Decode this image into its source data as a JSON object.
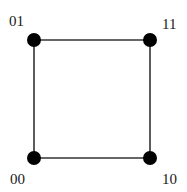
{
  "diagram": {
    "type": "graph",
    "shape": "square",
    "colors": {
      "node": "#000000",
      "edge": "#333333",
      "label": "#1a1a1a",
      "background": "#ffffff"
    },
    "nodes": [
      {
        "id": "01",
        "label": "01",
        "x": 34,
        "y": 40,
        "label_x": 9,
        "label_y": 26
      },
      {
        "id": "11",
        "label": "11",
        "x": 150,
        "y": 40,
        "label_x": 162,
        "label_y": 29
      },
      {
        "id": "00",
        "label": "00",
        "x": 34,
        "y": 158,
        "label_x": 10,
        "label_y": 184
      },
      {
        "id": "10",
        "label": "10",
        "x": 150,
        "y": 158,
        "label_x": 162,
        "label_y": 184
      }
    ],
    "edges": [
      {
        "from": "01",
        "to": "11"
      },
      {
        "from": "11",
        "to": "10"
      },
      {
        "from": "10",
        "to": "00"
      },
      {
        "from": "00",
        "to": "01"
      }
    ]
  }
}
